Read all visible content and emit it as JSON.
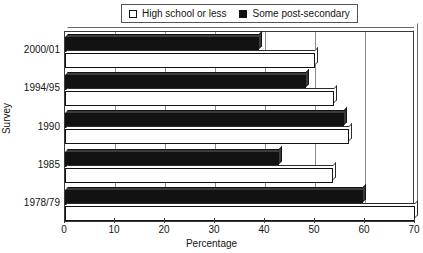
{
  "chart_data": {
    "type": "bar",
    "orientation": "horizontal",
    "title": "",
    "xlabel": "Percentage",
    "ylabel": "Survey",
    "categories": [
      "2000/01",
      "1994/95",
      "1990",
      "1985",
      "1978/79"
    ],
    "series": [
      {
        "name": "High school or less",
        "color": "#ffffff",
        "swatch": "white",
        "values": [
          50.0,
          53.8,
          56.8,
          53.6,
          70.0
        ]
      },
      {
        "name": "Some post-secondary",
        "color": "#121212",
        "swatch": "black",
        "values": [
          38.8,
          48.2,
          55.8,
          42.8,
          59.6
        ]
      }
    ],
    "xlim": [
      0,
      70
    ],
    "xticks": [
      0,
      10,
      20,
      30,
      40,
      50,
      60,
      70
    ],
    "xtick_labels": [
      "0",
      "10",
      "20",
      "30",
      "40",
      "50",
      "60",
      "70"
    ],
    "grid": true,
    "grid_axis": "x",
    "legend_position": "top-center"
  },
  "legend": {
    "entries": [
      {
        "label": "High school or less",
        "swatch": "white"
      },
      {
        "label": "Some post-secondary",
        "swatch": "black"
      }
    ]
  },
  "axes": {
    "x_title": "Percentage",
    "y_title": "Survey"
  }
}
